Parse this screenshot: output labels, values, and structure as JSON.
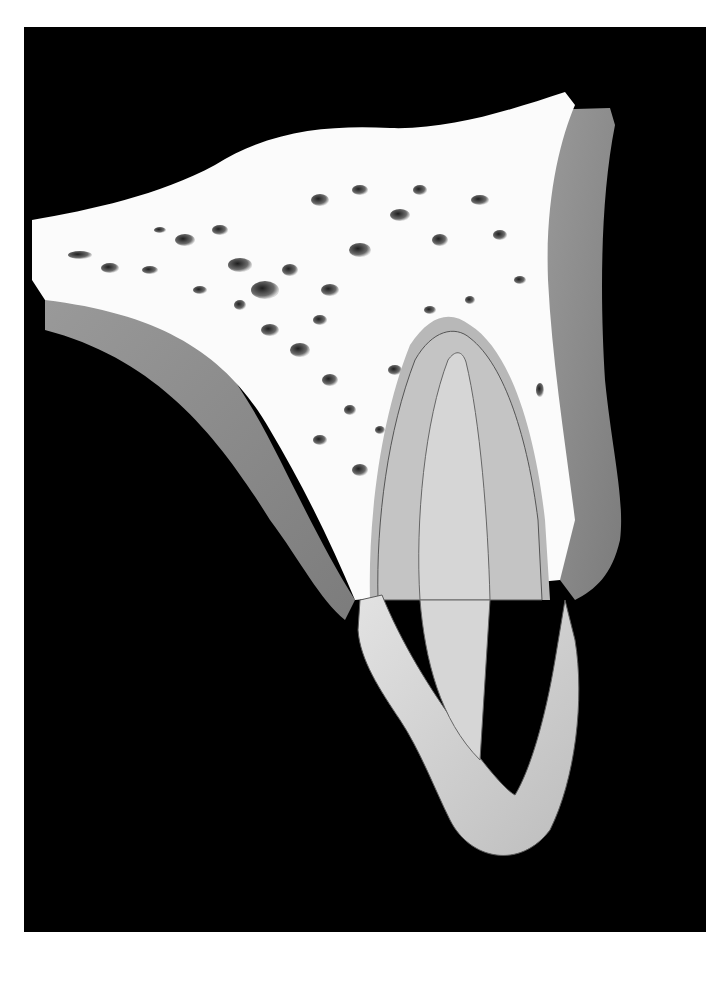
{
  "illustration": {
    "subject": "tooth-in-alveolar-bone-cross-section",
    "style": "grayscale anatomical illustration",
    "colors": {
      "page": "#ffffff",
      "panel": "#000000",
      "bone": "#fbfbfb",
      "bone_pores": "#3a3a3a",
      "gingiva": "#8c8c8c",
      "root": "#c4c4c4",
      "pulp": "#d6d6d6",
      "crown": "#d9d9d9",
      "outline": "#555555"
    }
  }
}
